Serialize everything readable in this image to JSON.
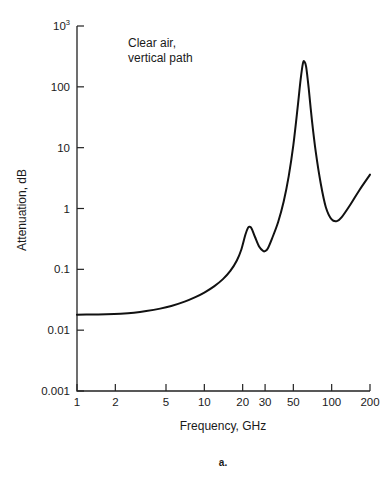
{
  "chart_data": {
    "type": "line",
    "title": "",
    "xlabel": "Frequency, GHz",
    "ylabel": "Attenuation, dB",
    "xscale": "log",
    "yscale": "log",
    "xlim": [
      1,
      200
    ],
    "ylim": [
      0.001,
      1000
    ],
    "xticks": [
      1,
      2,
      5,
      10,
      20,
      30,
      50,
      100,
      200
    ],
    "xticklabels": [
      "1",
      "2",
      "5",
      "10",
      "20",
      "30",
      "50",
      "100",
      "200"
    ],
    "yticks": [
      0.001,
      0.01,
      0.1,
      1,
      10,
      100,
      1000
    ],
    "yticklabels": [
      "0.001",
      "0.01",
      "0.1",
      "1",
      "10",
      "100",
      "10"
    ],
    "ytick_top_label_base": "10",
    "ytick_top_label_exp": "3",
    "grid": false,
    "legend": null,
    "annotations": [
      {
        "text_line1": "Clear air,",
        "text_line2": "vertical path",
        "x": 4.6,
        "y": 300
      }
    ],
    "figure_label": "a.",
    "series": [
      {
        "name": "Clear air, vertical path",
        "points": [
          [
            1.0,
            0.018
          ],
          [
            1.3,
            0.0181
          ],
          [
            1.7,
            0.0183
          ],
          [
            2.2,
            0.0187
          ],
          [
            2.8,
            0.0194
          ],
          [
            3.5,
            0.0206
          ],
          [
            4.5,
            0.0226
          ],
          [
            5.5,
            0.025
          ],
          [
            7.0,
            0.0295
          ],
          [
            8.5,
            0.035
          ],
          [
            10.0,
            0.0415
          ],
          [
            12.0,
            0.053
          ],
          [
            14.0,
            0.069
          ],
          [
            16.0,
            0.094
          ],
          [
            18.0,
            0.14
          ],
          [
            19.5,
            0.21
          ],
          [
            21.0,
            0.37
          ],
          [
            22.0,
            0.48
          ],
          [
            22.6,
            0.5
          ],
          [
            23.5,
            0.47
          ],
          [
            25.0,
            0.34
          ],
          [
            27.0,
            0.235
          ],
          [
            29.0,
            0.2
          ],
          [
            30.0,
            0.2
          ],
          [
            31.5,
            0.22
          ],
          [
            34.0,
            0.32
          ],
          [
            38.0,
            0.6
          ],
          [
            42.0,
            1.3
          ],
          [
            46.0,
            3.4
          ],
          [
            50.0,
            11.0
          ],
          [
            54.0,
            45.0
          ],
          [
            57.0,
            130.0
          ],
          [
            59.5,
            245.0
          ],
          [
            61.0,
            260.0
          ],
          [
            63.0,
            215.0
          ],
          [
            66.0,
            95.0
          ],
          [
            70.0,
            28.0
          ],
          [
            75.0,
            8.5
          ],
          [
            82.0,
            2.6
          ],
          [
            90.0,
            1.05
          ],
          [
            100.0,
            0.66
          ],
          [
            110.0,
            0.62
          ],
          [
            120.0,
            0.72
          ],
          [
            140.0,
            1.15
          ],
          [
            165.0,
            2.0
          ],
          [
            200.0,
            3.6
          ]
        ]
      }
    ]
  },
  "axes": {
    "y_axis_title": "Attenuation, dB",
    "x_axis_title": "Frequency, GHz"
  },
  "caption": {
    "figure_label": "a."
  }
}
